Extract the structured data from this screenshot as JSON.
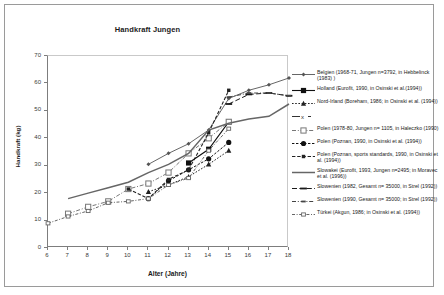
{
  "chart_data": {
    "type": "line",
    "title": "Handkraft Jungen",
    "xlabel": "Alter (Jahre)",
    "ylabel": "Handkraft (kg)",
    "xlim": [
      6,
      18
    ],
    "ylim": [
      0,
      70
    ],
    "xticks": [
      6,
      7,
      8,
      9,
      10,
      11,
      12,
      13,
      14,
      15,
      16,
      17,
      18
    ],
    "yticks": [
      0,
      10,
      20,
      30,
      40,
      50,
      60,
      70
    ],
    "grid": false,
    "legend_position": "right",
    "series": [
      {
        "name": "Belgien (1968-71, Jungen n=3792, in Hebbelinck (1983) )",
        "marker": "diamond-small",
        "color": "#555555",
        "x": [
          11,
          12,
          13,
          14,
          15,
          16,
          17,
          18
        ],
        "values": [
          30.5,
          34.5,
          38.0,
          43.0,
          54.5,
          57.5,
          59.5,
          62.0
        ]
      },
      {
        "name": "Holland (Eurofit, 1990, in Osinski et al.(1994))",
        "marker": "square-filled",
        "color": "#111111",
        "x": [
          13,
          14,
          15
        ],
        "values": [
          31.0,
          36.0,
          46.0
        ]
      },
      {
        "name": "Nord-Irland (Boreham, 1986, in Osinski et al. (1994))",
        "marker": "triangle-filled",
        "color": "#222222",
        "x": [
          11,
          12,
          13,
          14,
          15
        ],
        "values": [
          20.5,
          23.0,
          26.0,
          30.5,
          35.5
        ]
      },
      {
        "name": "",
        "marker": "x-cross",
        "color": "#333333",
        "x": [],
        "values": []
      },
      {
        "name": "Polen (1978-80, Jungen n= 1105, in Haleczko (1990)",
        "marker": "square-open",
        "color": "#777777",
        "x": [
          7,
          8,
          9,
          10,
          11,
          12,
          13,
          14,
          15
        ],
        "values": [
          12.5,
          15.0,
          17.0,
          21.5,
          23.5,
          27.5,
          34.5,
          40.0,
          46.0
        ]
      },
      {
        "name": "Polen (Poznan, 1990, in Osinski et al. (1994))",
        "marker": "circle-filled",
        "color": "#111111",
        "x": [
          11,
          12,
          13,
          14,
          15
        ],
        "values": [
          18.0,
          24.5,
          28.5,
          32.5,
          38.5
        ]
      },
      {
        "name": "Polen (Poznan, sports standards, 1990, in Osinski et al. (1994))",
        "marker": "square-filled-small",
        "color": "#222222",
        "x": [
          10,
          11,
          12,
          13,
          14,
          15
        ],
        "values": [
          21.5,
          18.0,
          25.0,
          28.5,
          42.0,
          57.5
        ]
      },
      {
        "name": "Slowakei (Eurofit, 1993, Jungen n=2495; in Moravec et al. (1996))",
        "marker": "line-only",
        "color": "#666666",
        "x": [
          7,
          8,
          9,
          10,
          11,
          12,
          13,
          14,
          15,
          16,
          17,
          18
        ],
        "values": [
          18.0,
          20.0,
          22.0,
          24.0,
          27.5,
          30.5,
          34.5,
          43.0,
          45.5,
          47.0,
          48.0,
          52.5
        ]
      },
      {
        "name": "Slowenien (1982, Gesamt n= 35000, in Strel (1992))",
        "marker": "dash",
        "color": "#1a1a1a",
        "x": [
          15,
          16,
          17,
          18
        ],
        "values": [
          52.5,
          56.0,
          56.5,
          55.5
        ]
      },
      {
        "name": "Slowenien (1990, Gesamt n= 35000; in Strel (1992))",
        "marker": "dash-dot-marker",
        "color": "#444444",
        "x": [
          15,
          16,
          17,
          18
        ],
        "values": [
          55.0,
          56.5,
          56.5,
          55.5
        ]
      },
      {
        "name": "Türkei (Akgun, 1986; in Osinski et al. (1994))",
        "marker": "rect-open-dash",
        "color": "#666666",
        "x": [
          6,
          7,
          8,
          9,
          10,
          11,
          12,
          13,
          14,
          15
        ],
        "values": [
          9.0,
          11.5,
          13.5,
          16.5,
          17.0,
          18.0,
          23.0,
          25.5,
          35.5,
          43.5
        ]
      }
    ]
  },
  "legend": {
    "items": [
      "Belgien (1968-71, Jungen n=3792, in Hebbelinck (1983) )",
      "Holland (Eurofit, 1990, in Osinski et al.(1994))",
      "Nord-Irland (Boreham, 1986; in Osinski et al. (1994))",
      "",
      "Polen (1978-80, Jungen n= 1105, in Haleczko (1990)",
      "Polen (Poznan, 1990, in Osinski et al. (1994))",
      "Polen (Poznan, sports standards, 1990, in Osinski et al. (1994))",
      "Slowakei (Eurofit, 1993, Jungen n=2495; in Moravec et al. (1996))",
      "Slowenien (1982, Gesamt n= 35000, in Strel (1992))",
      "Slowenien (1990, Gesamt n= 35000; in Strel (1992))",
      "Türkei (Akgun, 1986; in Osinski et al. (1994))"
    ]
  }
}
